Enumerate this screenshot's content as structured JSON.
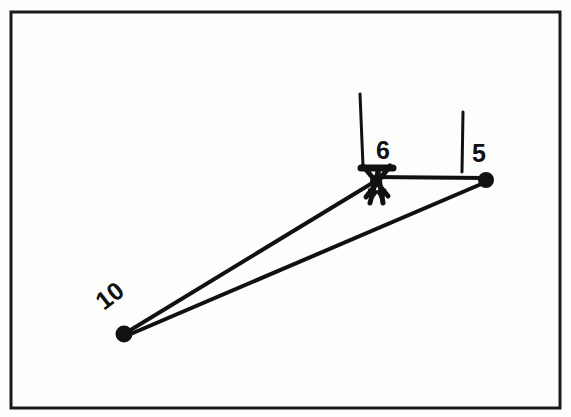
{
  "figure": {
    "background_color": "#fdfdfc",
    "ink_color": "#111111",
    "frame": {
      "name": "border-frame",
      "x": 11,
      "y": 12,
      "width": 549,
      "height": 396,
      "stroke_width": 3,
      "color": "#1a1a1a"
    },
    "nodes": [
      {
        "id": "node-10",
        "label": "10",
        "cx": 124,
        "cy": 334,
        "r": 8.5,
        "label_x": 104,
        "label_y": 311,
        "label_rotation": -38,
        "label_font_size": 25
      },
      {
        "id": "node-6",
        "label": "6",
        "cx": 375,
        "cy": 181,
        "r": 5,
        "label_x": 376,
        "label_y": 159,
        "label_rotation": 0,
        "label_font_size": 25
      },
      {
        "id": "node-5",
        "label": "5",
        "cx": 486,
        "cy": 180,
        "r": 8,
        "label_x": 472,
        "label_y": 162,
        "label_rotation": 0,
        "label_font_size": 25
      }
    ],
    "members": [
      {
        "id": "member-10-6",
        "from": "node-10",
        "to": "node-6",
        "x1": 124,
        "y1": 334,
        "x2": 374,
        "y2": 182,
        "stroke_width": 4
      },
      {
        "id": "member-10-5",
        "from": "node-10",
        "to": "node-5",
        "x1": 126,
        "y1": 336,
        "x2": 486,
        "y2": 182,
        "stroke_width": 4
      },
      {
        "id": "member-6-5",
        "from": "node-6",
        "to": "node-5",
        "x1": 372,
        "y1": 177,
        "x2": 486,
        "y2": 178,
        "stroke_width": 4
      }
    ],
    "ticks": [
      {
        "id": "tick-node-6",
        "x1": 360,
        "y1": 94,
        "x2": 363,
        "y2": 166,
        "stroke_width": 3
      },
      {
        "id": "tick-node-5",
        "x1": 463,
        "y1": 112,
        "x2": 462,
        "y2": 172,
        "stroke_width": 3
      }
    ],
    "node6_detail": {
      "top_bar": {
        "id": "node-6-top-bar",
        "x1": 361,
        "y1": 168,
        "x2": 393,
        "y2": 168,
        "stroke_width": 7
      },
      "cross_strokes": [
        {
          "id": "node-6-cross-a",
          "x1": 363,
          "y1": 166,
          "x2": 388,
          "y2": 196,
          "stroke_width": 5
        },
        {
          "id": "node-6-cross-b",
          "x1": 390,
          "y1": 166,
          "x2": 366,
          "y2": 197,
          "stroke_width": 5
        }
      ],
      "arrows": [
        {
          "id": "force-arrow-left",
          "direction": "down",
          "x1": 378,
          "y1": 172,
          "x2": 370,
          "y2": 203,
          "stroke_width": 5,
          "head_size": 9
        },
        {
          "id": "force-arrow-right",
          "direction": "down",
          "x1": 378,
          "y1": 172,
          "x2": 383,
          "y2": 203,
          "stroke_width": 5,
          "head_size": 9
        }
      ]
    }
  }
}
